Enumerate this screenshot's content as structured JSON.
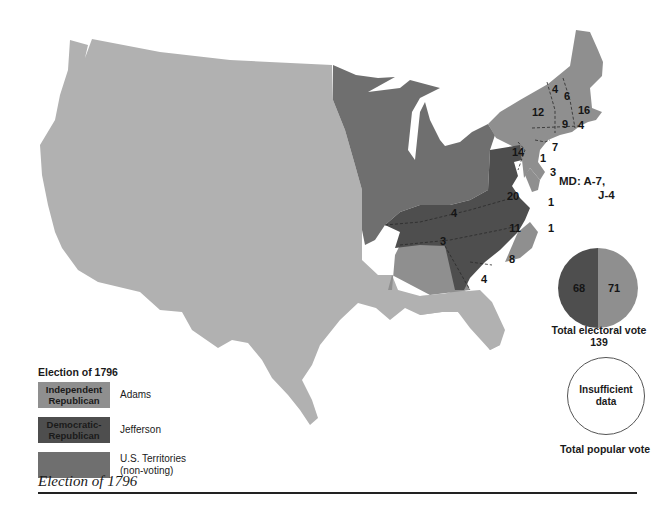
{
  "title": "Election of 1796",
  "colors": {
    "adams": "#8f8f8f",
    "jefferson": "#4e4e4e",
    "territories": "#6f6f6f",
    "unorganized": "#b1b1b1",
    "background": "#ffffff"
  },
  "legend": {
    "title": "Election of 1796",
    "items": [
      {
        "swatch_label": "Independent Republican",
        "label": "Adams"
      },
      {
        "swatch_label": "Democratic-Republican",
        "label": "Jefferson"
      },
      {
        "swatch_label": "",
        "label": "U.S. Territories (non-voting)"
      }
    ]
  },
  "map": {
    "state_votes": [
      {
        "state": "VT",
        "votes": "4"
      },
      {
        "state": "NH",
        "votes": "6"
      },
      {
        "state": "MA",
        "votes": "16"
      },
      {
        "state": "NY",
        "votes": "12"
      },
      {
        "state": "CT",
        "votes": "9"
      },
      {
        "state": "RI",
        "votes": "4"
      },
      {
        "state": "NJ",
        "votes": "7"
      },
      {
        "state": "PA",
        "votes": "14"
      },
      {
        "state": "PA-A",
        "votes": "1"
      },
      {
        "state": "DE",
        "votes": "3"
      },
      {
        "state": "VA",
        "votes": "20"
      },
      {
        "state": "VA-A",
        "votes": "1"
      },
      {
        "state": "KY",
        "votes": "4"
      },
      {
        "state": "TN",
        "votes": "3"
      },
      {
        "state": "NC",
        "votes": "11"
      },
      {
        "state": "NC-A",
        "votes": "1"
      },
      {
        "state": "SC",
        "votes": "8"
      },
      {
        "state": "GA",
        "votes": "4"
      }
    ],
    "md_note": {
      "line1": "MD:  A-7,",
      "line2": "J-4"
    }
  },
  "electoral": {
    "jefferson": "68",
    "adams": "71",
    "caption": "Total electoral vote",
    "total": "139"
  },
  "popular": {
    "text": "Insufficient data",
    "caption": "Total popular vote"
  },
  "caption": "Election of 1796"
}
